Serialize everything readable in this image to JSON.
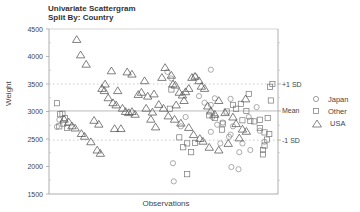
{
  "chart_data": {
    "type": "scatter",
    "title": "Univariate Scattergram",
    "subtitle": "Split By: Country",
    "xlabel": "Observations",
    "ylabel": "Weight",
    "ylim": [
      1500,
      4500
    ],
    "yticks": [
      1500,
      2000,
      2500,
      3000,
      3500,
      4000,
      4500
    ],
    "grid": false,
    "legend_position": "right",
    "reference_lines": [
      {
        "label": "+1 SD",
        "value": 3500,
        "style": "dotted"
      },
      {
        "label": "Mean",
        "value": 3010,
        "style": "solid"
      },
      {
        "label": "-1 SD",
        "value": 2480,
        "style": "dotted"
      }
    ],
    "series": [
      {
        "name": "Japan",
        "marker": "circle",
        "points": [
          [
            5,
            2720
          ],
          [
            8,
            2850
          ],
          [
            145,
            3720
          ],
          [
            150,
            3600
          ],
          [
            180,
            3640
          ],
          [
            185,
            3280
          ],
          [
            192,
            3160
          ],
          [
            200,
            3120
          ],
          [
            205,
            3240
          ],
          [
            215,
            2800
          ],
          [
            225,
            2580
          ],
          [
            228,
            2730
          ],
          [
            240,
            2420
          ],
          [
            250,
            2300
          ],
          [
            258,
            3080
          ],
          [
            262,
            2650
          ],
          [
            268,
            2450
          ],
          [
            200,
            2630
          ],
          [
            208,
            2760
          ],
          [
            152,
            2060
          ],
          [
            162,
            2730
          ],
          [
            212,
            2420
          ],
          [
            168,
            2900
          ],
          [
            236,
            2260
          ],
          [
            248,
            2900
          ],
          [
            223,
            2540
          ],
          [
            235,
            1950
          ],
          [
            226,
            1990
          ],
          [
            153,
            1730
          ],
          [
            200,
            3760
          ],
          [
            225,
            3230
          ],
          [
            202,
            2900
          ]
        ]
      },
      {
        "name": "Other",
        "marker": "square",
        "points": [
          [
            5,
            3150
          ],
          [
            9,
            2950
          ],
          [
            12,
            2960
          ],
          [
            13,
            2780
          ],
          [
            15,
            2880
          ],
          [
            8,
            2730
          ],
          [
            18,
            2700
          ],
          [
            160,
            2530
          ],
          [
            165,
            2350
          ],
          [
            170,
            2420
          ],
          [
            175,
            2260
          ],
          [
            180,
            2430
          ],
          [
            198,
            2930
          ],
          [
            205,
            2880
          ],
          [
            215,
            2780
          ],
          [
            220,
            3000
          ],
          [
            228,
            3120
          ],
          [
            232,
            3050
          ],
          [
            238,
            3140
          ],
          [
            245,
            3010
          ],
          [
            250,
            2830
          ],
          [
            255,
            2820
          ],
          [
            262,
            2850
          ],
          [
            268,
            2620
          ],
          [
            271,
            2490
          ],
          [
            274,
            2590
          ],
          [
            240,
            2840
          ],
          [
            248,
            3320
          ],
          [
            266,
            2300
          ],
          [
            275,
            3450
          ],
          [
            278,
            3500
          ],
          [
            276,
            3200
          ],
          [
            272,
            2880
          ],
          [
            262,
            2700
          ],
          [
            170,
            1860
          ],
          [
            268,
            2380
          ],
          [
            266,
            2220
          ],
          [
            214,
            2670
          ],
          [
            148,
            3050
          ],
          [
            150,
            3400
          ]
        ]
      },
      {
        "name": "USA",
        "marker": "triangle",
        "points": [
          [
            30,
            4310
          ],
          [
            35,
            4030
          ],
          [
            42,
            3860
          ],
          [
            62,
            3420
          ],
          [
            65,
            3380
          ],
          [
            70,
            3250
          ],
          [
            76,
            3160
          ],
          [
            80,
            3120
          ],
          [
            88,
            3060
          ],
          [
            92,
            3000
          ],
          [
            96,
            2980
          ],
          [
            100,
            3000
          ],
          [
            112,
            3350
          ],
          [
            120,
            3280
          ],
          [
            124,
            2860
          ],
          [
            130,
            2720
          ],
          [
            138,
            3620
          ],
          [
            142,
            3800
          ],
          [
            150,
            3660
          ],
          [
            152,
            3500
          ],
          [
            155,
            3480
          ],
          [
            160,
            3350
          ],
          [
            164,
            3300
          ],
          [
            168,
            3360
          ],
          [
            172,
            3420
          ],
          [
            176,
            3620
          ],
          [
            180,
            3640
          ],
          [
            185,
            3560
          ],
          [
            188,
            3460
          ],
          [
            192,
            3420
          ],
          [
            196,
            3100
          ],
          [
            200,
            3010
          ],
          [
            205,
            2950
          ],
          [
            210,
            3200
          ],
          [
            218,
            2980
          ],
          [
            228,
            2900
          ],
          [
            232,
            2780
          ],
          [
            240,
            2680
          ],
          [
            245,
            2640
          ],
          [
            14,
            2860
          ],
          [
            20,
            2810
          ],
          [
            24,
            2740
          ],
          [
            28,
            2700
          ],
          [
            36,
            2600
          ],
          [
            40,
            2550
          ],
          [
            48,
            2450
          ],
          [
            56,
            2300
          ],
          [
            60,
            2240
          ],
          [
            66,
            3500
          ],
          [
            74,
            3740
          ],
          [
            82,
            3380
          ],
          [
            94,
            3720
          ],
          [
            100,
            3680
          ],
          [
            108,
            3310
          ],
          [
            116,
            3560
          ],
          [
            128,
            3320
          ],
          [
            134,
            3130
          ],
          [
            140,
            3060
          ],
          [
            146,
            2920
          ],
          [
            154,
            2860
          ],
          [
            162,
            2790
          ],
          [
            172,
            2710
          ],
          [
            178,
            2580
          ],
          [
            186,
            2510
          ],
          [
            190,
            2460
          ],
          [
            198,
            2350
          ],
          [
            210,
            2300
          ],
          [
            222,
            2420
          ],
          [
            236,
            2520
          ],
          [
            244,
            3230
          ],
          [
            52,
            2840
          ],
          [
            58,
            2770
          ],
          [
            78,
            2690
          ],
          [
            86,
            2690
          ],
          [
            104,
            2950
          ],
          [
            118,
            3060
          ],
          [
            126,
            2990
          ],
          [
            156,
            3120
          ],
          [
            166,
            3200
          ]
        ]
      }
    ]
  },
  "legend": {
    "items": [
      {
        "label": "Japan"
      },
      {
        "label": "Other"
      },
      {
        "label": "USA"
      }
    ]
  },
  "labels": {
    "title": "Univariate Scattergram",
    "subtitle": "Split By: Country",
    "xlabel": "Observations",
    "ylabel": "Weight",
    "plus_sd": "+1 SD",
    "mean": "Mean",
    "minus_sd": "-1 SD"
  }
}
